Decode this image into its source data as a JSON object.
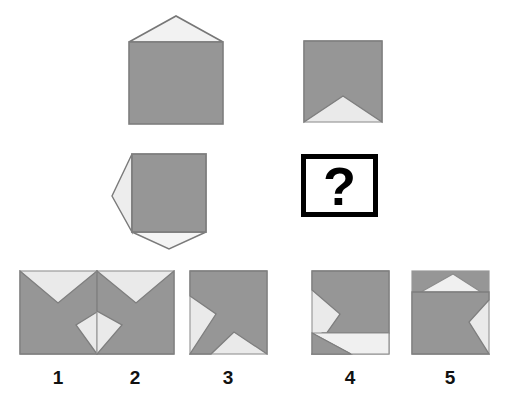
{
  "puzzle": {
    "type": "visual-analogy-matrix",
    "title": "Shape transformation matrix puzzle",
    "question_mark": "?",
    "colors": {
      "shape_fill": "#969696",
      "cut_fill": "#eaeaea",
      "outline": "#7a7a7a",
      "question_border": "#000000",
      "background": "#ffffff",
      "label_color": "#111111"
    }
  },
  "matrix": {
    "rows": 2,
    "cols": 2,
    "cells": [
      {
        "position": "top-left",
        "name": "square-with-upward-triangle",
        "description": "Gray square with a triangle protruding outward from the top edge",
        "base": "square",
        "features": [
          {
            "edge": "top",
            "direction": "outward",
            "shape": "triangle"
          }
        ]
      },
      {
        "position": "top-right",
        "name": "square-with-bottom-notch",
        "description": "Gray square with a triangular notch cut inward from the bottom edge",
        "base": "square",
        "features": [
          {
            "edge": "bottom",
            "direction": "inward",
            "shape": "triangle"
          }
        ]
      },
      {
        "position": "middle-left",
        "name": "square-with-left-and-bottom-triangles",
        "description": "Gray square with triangles protruding outward from the left edge and the bottom edge",
        "base": "square",
        "features": [
          {
            "edge": "left",
            "direction": "outward",
            "shape": "triangle"
          },
          {
            "edge": "bottom",
            "direction": "outward",
            "shape": "triangle"
          }
        ]
      },
      {
        "position": "middle-right",
        "name": "missing-answer-cell",
        "description": "White box with a thick black border containing a bold question mark",
        "base": "question-box",
        "features": []
      }
    ]
  },
  "options": {
    "count": 5,
    "labels": [
      "1",
      "2",
      "3",
      "4",
      "5"
    ],
    "items": [
      {
        "label": "1",
        "name": "option-1",
        "description": "Square with a triangular notch cut into the top edge and a triangular notch cut into the right edge",
        "features": [
          {
            "edge": "top",
            "direction": "inward",
            "shape": "triangle"
          },
          {
            "edge": "right",
            "direction": "inward",
            "shape": "triangle"
          }
        ]
      },
      {
        "label": "2",
        "name": "option-2",
        "description": "Square with a triangular notch cut into the top edge and a triangular notch cut into the left edge",
        "features": [
          {
            "edge": "top",
            "direction": "inward",
            "shape": "triangle"
          },
          {
            "edge": "left",
            "direction": "inward",
            "shape": "triangle"
          }
        ]
      },
      {
        "label": "3",
        "name": "option-3",
        "description": "Square with a triangular notch cut into the left edge and a triangular notch cut into the bottom edge",
        "features": [
          {
            "edge": "left",
            "direction": "inward",
            "shape": "triangle"
          },
          {
            "edge": "bottom",
            "direction": "inward",
            "shape": "triangle"
          }
        ]
      },
      {
        "label": "4",
        "name": "option-4",
        "description": "Square with a triangular notch cut into the left edge and a wide triangular notch cut into the bottom edge",
        "features": [
          {
            "edge": "left",
            "direction": "inward",
            "shape": "triangle"
          },
          {
            "edge": "bottom",
            "direction": "inward",
            "shape": "triangle-wide"
          }
        ]
      },
      {
        "label": "5",
        "name": "option-5",
        "description": "Square with a shallow triangular wedge cut near the top edge and a triangular notch cut into the right edge",
        "features": [
          {
            "edge": "top",
            "direction": "inward",
            "shape": "triangle-band"
          },
          {
            "edge": "right",
            "direction": "inward",
            "shape": "triangle"
          }
        ]
      }
    ]
  }
}
